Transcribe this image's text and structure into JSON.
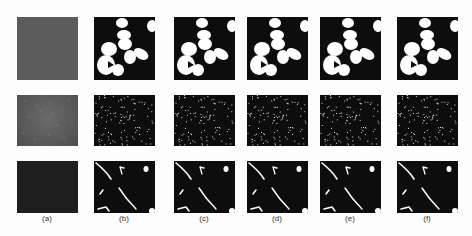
{
  "figure": {
    "columns": [
      {
        "label": "(a)",
        "x": 17,
        "w": 61
      },
      {
        "label": "(b)",
        "x": 94,
        "w": 61
      },
      {
        "label": "(c)",
        "x": 174,
        "w": 61
      },
      {
        "label": "(d)",
        "x": 247,
        "w": 61
      },
      {
        "label": "(e)",
        "x": 320,
        "w": 61
      },
      {
        "label": "(f)",
        "x": 397,
        "w": 61
      }
    ],
    "rows": [
      {
        "name": "blobs",
        "y": 17,
        "h": 63,
        "original_color": "#5a5a5a"
      },
      {
        "name": "speckle",
        "y": 95,
        "h": 51,
        "original_color": "#555555"
      },
      {
        "name": "filaments",
        "y": 161,
        "h": 52,
        "original_color": "#1c1c1c"
      }
    ],
    "colors": {
      "background": "#fdfdfd",
      "segment_bg": "#0d0d0d",
      "foreground": "#ffffff"
    }
  }
}
